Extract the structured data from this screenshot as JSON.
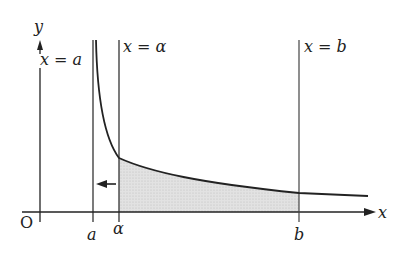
{
  "diagram": {
    "axes": {
      "x_label": "x",
      "y_label": "y",
      "origin_label": "O"
    },
    "vertical_lines": [
      {
        "id": "a",
        "label": "x = a",
        "tick_label": "a"
      },
      {
        "id": "alpha",
        "label": "x = α",
        "tick_label": "α"
      },
      {
        "id": "b",
        "label": "x = b",
        "tick_label": "b"
      }
    ],
    "curve": "decreasing curve with vertical asymptote x = a",
    "shaded_region": "area under curve between x = α and x = b",
    "arrow": "points left from x = α toward x = a",
    "colors": {
      "stroke": "#222222",
      "shade": "#d9d9d9"
    }
  }
}
